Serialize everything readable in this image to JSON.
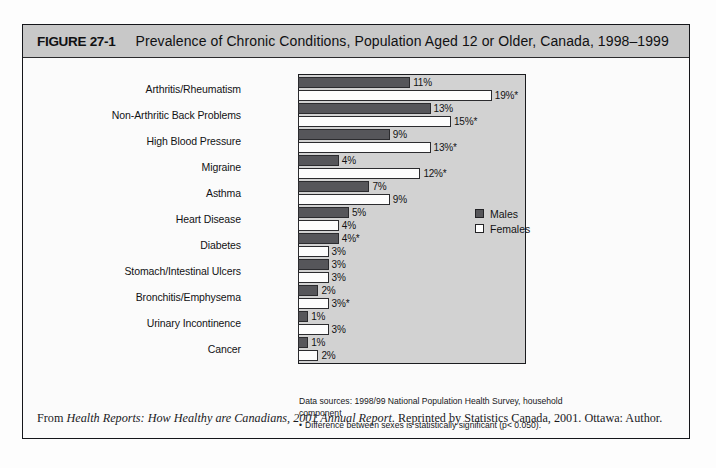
{
  "figure": {
    "number": "FIGURE 27-1",
    "title": "Prevalence of Chronic Conditions, Population Aged 12 or Older, Canada, 1998–1999"
  },
  "legend": {
    "males_label": "Males",
    "females_label": "Females",
    "male_color": "#56565a",
    "female_color": "#ffffff"
  },
  "source": {
    "line1": "Data sources:  1998/99 National Population Health Survey, household",
    "line2": "component",
    "bullet": "•",
    "footnote": "Difference between sexes is statistically significant (p< 0.050)."
  },
  "attribution": {
    "prefix": "From ",
    "italic_title": "Health Reports: How Healthy are Canadians, 2001 Annual Report",
    "suffix": ". Reprinted by Statistics Canada, 2001. Ottawa: Author."
  },
  "chart_data": {
    "type": "bar",
    "orientation": "horizontal",
    "title": "Prevalence of Chronic Conditions, Population Aged 12 or Older, Canada, 1998–1999",
    "xlabel": "",
    "ylabel": "",
    "xlim": [
      0,
      20
    ],
    "grid": false,
    "legend_position": "right-middle",
    "categories": [
      "Arthritis/Rheumatism",
      "Non-Arthritic Back Problems",
      "High Blood Pressure",
      "Migraine",
      "Asthma",
      "Heart Disease",
      "Diabetes",
      "Stomach/Intestinal Ulcers",
      "Bronchitis/Emphysema",
      "Urinary Incontinence",
      "Cancer"
    ],
    "series": [
      {
        "name": "Males",
        "values": [
          11,
          13,
          9,
          4,
          7,
          5,
          4,
          3,
          2,
          1,
          1
        ],
        "labels": [
          "11%",
          "13%",
          "9%",
          "4%",
          "7%",
          "5%",
          "4%*",
          "3%",
          "2%",
          "1%",
          "1%"
        ]
      },
      {
        "name": "Females",
        "values": [
          19,
          15,
          13,
          12,
          9,
          4,
          3,
          3,
          3,
          3,
          2
        ],
        "labels": [
          "19%*",
          "15%*",
          "13%*",
          "12%*",
          "9%",
          "4%",
          "3%",
          "3%",
          "3%*",
          "3%",
          "2%"
        ]
      }
    ],
    "annotations": [
      "* Difference between sexes is statistically significant (p< 0.050)."
    ]
  }
}
